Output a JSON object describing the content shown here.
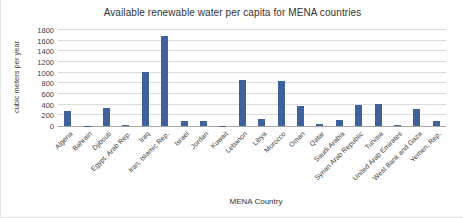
{
  "chart_data": {
    "type": "bar",
    "title": "Available renewable  water per capita for  MENA countries",
    "xlabel": "MENA Country",
    "ylabel": "cubic meters  per year",
    "categories": [
      "Algeria",
      "Bahrain",
      "Djibouti",
      "Egypt, Arab Rep.",
      "Iraq",
      "Iran, Islamic Rep.",
      "Israel",
      "Jordan",
      "Kuwait",
      "Lebanon",
      "Libya",
      "Morocco",
      "Oman",
      "Qatar",
      "Saudi Arabia",
      "Syrian Arab Republic",
      "Tunisia",
      "United Arab Emirates",
      "West Bank and Gaza",
      "Yemen, Rep."
    ],
    "values": [
      290,
      5,
      330,
      25,
      1010,
      1680,
      100,
      85,
      5,
      870,
      125,
      850,
      370,
      30,
      115,
      390,
      410,
      25,
      320,
      85
    ],
    "ylim": [
      0,
      1800
    ],
    "ytick_step": 200,
    "grid": true,
    "legend": "none",
    "bar_color": "#40629c"
  },
  "colors": {
    "bar": "#40629c",
    "gridline": "#dcdcdc",
    "axis_line": "#a6a6a6",
    "text": "#404040"
  }
}
